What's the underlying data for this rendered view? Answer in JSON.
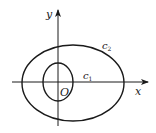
{
  "diagram": {
    "type": "coordinate-plane-with-curves",
    "axes": {
      "x_label": "x",
      "y_label": "y",
      "origin_label": "O"
    },
    "curves": [
      {
        "id": "inner",
        "label": "c",
        "subscript": "1",
        "shape": "ellipse"
      },
      {
        "id": "outer",
        "label": "c",
        "subscript": "2",
        "shape": "ellipse"
      }
    ],
    "colors": {
      "stroke": "#1a1a1a",
      "text": "#222222",
      "background": "#ffffff"
    }
  }
}
